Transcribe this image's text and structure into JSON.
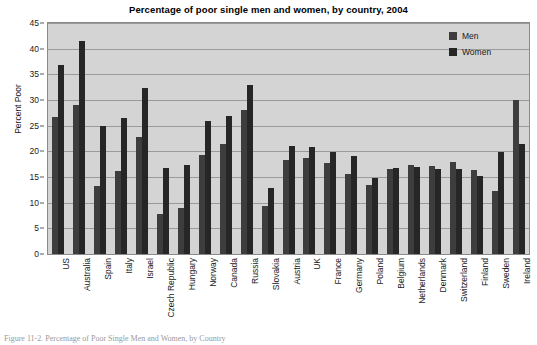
{
  "chart_data": {
    "type": "bar",
    "title": "Percentage of poor single men and women, by country, 2004",
    "xlabel": "",
    "ylabel": "Percent Poor",
    "ylim": [
      0,
      45
    ],
    "ytick_step": 5,
    "yticks": [
      0,
      5,
      10,
      15,
      20,
      25,
      30,
      35,
      40,
      45
    ],
    "grid": true,
    "legend_position": "top-right",
    "categories": [
      "US",
      "Australia",
      "Spain",
      "Italy",
      "Israel",
      "Czech Republic",
      "Hungary",
      "Norway",
      "Canada",
      "Russia",
      "Slovakia",
      "Austria",
      "UK",
      "France",
      "Germany",
      "Poland",
      "Belgium",
      "Netherlands",
      "Denmark",
      "Switzerland",
      "Finland",
      "Sweden",
      "Ireland"
    ],
    "series": [
      {
        "name": "Men",
        "color": "#3d3d3d",
        "values": [
          26.7,
          29.0,
          13.2,
          16.2,
          22.7,
          7.8,
          9.0,
          19.2,
          21.5,
          28.0,
          9.3,
          18.3,
          18.7,
          17.8,
          15.5,
          13.5,
          16.5,
          17.3,
          17.2,
          17.9,
          16.3,
          12.2,
          30.0
        ]
      },
      {
        "name": "Women",
        "color": "#262626",
        "values": [
          36.8,
          41.5,
          25.0,
          26.5,
          32.3,
          16.8,
          17.3,
          26.0,
          26.8,
          33.0,
          12.8,
          21.0,
          20.9,
          19.8,
          19.0,
          14.8,
          16.8,
          16.9,
          16.5,
          16.5,
          15.2,
          19.8,
          21.5
        ]
      }
    ]
  },
  "legend": {
    "items": [
      {
        "label": "Men"
      },
      {
        "label": "Women"
      }
    ]
  },
  "caption": {
    "text": "Figure 11-2.  Percentage of Poor Single Men and Women, by Country"
  },
  "colors": {
    "men": "#3d3d3d",
    "women": "#262626",
    "plot_background": "#d4d4d4",
    "gridline": "#8f8f8f",
    "text": "#1a1a1a"
  }
}
